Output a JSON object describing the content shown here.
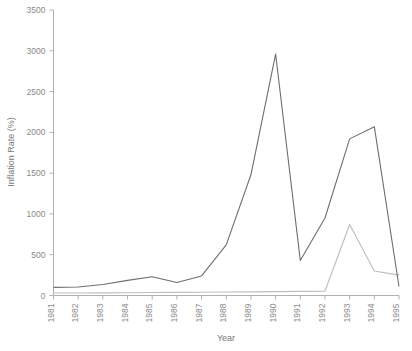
{
  "chart_data": {
    "type": "line",
    "title": "",
    "xlabel": "Year",
    "ylabel": "Inflation Rate (%)",
    "categories": [
      1981,
      1982,
      1983,
      1984,
      1985,
      1986,
      1987,
      1988,
      1989,
      1990,
      1991,
      1992,
      1993,
      1994,
      1995
    ],
    "x_tick_labels": [
      "1981",
      "1982",
      "1983",
      "1984",
      "1985",
      "1986",
      "1987",
      "1988",
      "1989",
      "1990",
      "1991",
      "1992",
      "1993",
      "1994",
      "1995"
    ],
    "y_tick_labels": [
      "0",
      "500",
      "1000",
      "1500",
      "2000",
      "2500",
      "3000",
      "3500"
    ],
    "y_ticks": [
      0,
      500,
      1000,
      1500,
      2000,
      2500,
      3000,
      3500
    ],
    "ylim": [
      0,
      3500
    ],
    "xlim": [
      1981,
      1995
    ],
    "grid": false,
    "legend": "none",
    "series": [
      {
        "name": "Main inflation series",
        "color": "#6e6e6e",
        "x": [
          1981,
          1982,
          1983,
          1984,
          1985,
          1986,
          1987,
          1988,
          1989,
          1990,
          1991,
          1992,
          1993,
          1994,
          1995
        ],
        "values": [
          100,
          105,
          135,
          185,
          230,
          160,
          240,
          620,
          1480,
          2960,
          430,
          950,
          1920,
          2070,
          110
        ]
      },
      {
        "name": "Secondary series",
        "color": "#bdbdbd",
        "x": [
          1981,
          1982,
          1983,
          1984,
          1985,
          1986,
          1987,
          1988,
          1989,
          1990,
          1991,
          1992,
          1993,
          1994,
          1995
        ],
        "values": [
          30,
          30,
          32,
          34,
          36,
          38,
          40,
          42,
          45,
          48,
          50,
          52,
          870,
          300,
          250
        ]
      }
    ]
  },
  "axes": {
    "y_title": "Inflation Rate (%)",
    "x_title": "Year"
  }
}
